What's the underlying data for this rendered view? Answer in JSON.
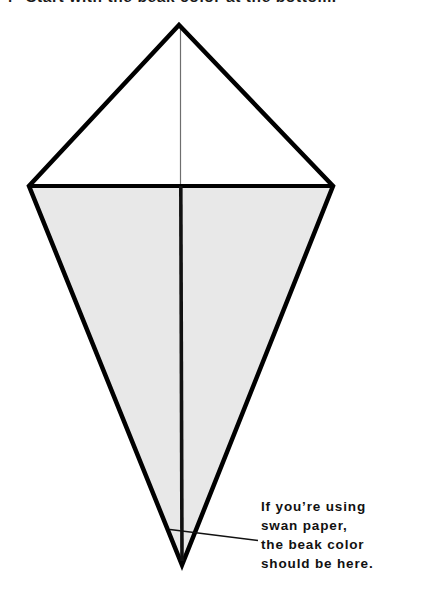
{
  "page": {
    "width": 425,
    "height": 612,
    "background_color": "#ffffff"
  },
  "heading": {
    "step_number": "4",
    "text": "Start with the beak color at the bottom.",
    "note": "clipped at top edge of screenshot"
  },
  "diagram": {
    "name": "origami-kite-base",
    "stroke_color": "#000000",
    "outline_stroke_width": 4.5,
    "upper_fill_color": "#ffffff",
    "lower_fill_color": "#e8e8e8",
    "center_line_upper_color": "#6e6e6e",
    "center_line_upper_width": 1.2,
    "center_line_lower_color": "#111111",
    "center_line_lower_width": 3.6,
    "horizontal_fold_color": "#000000",
    "horizontal_fold_width": 4.2,
    "points": {
      "top_apex": [
        179,
        25
      ],
      "left_vertex": [
        29,
        186
      ],
      "right_vertex": [
        333,
        186
      ],
      "bottom_point": [
        182,
        565
      ]
    }
  },
  "leader": {
    "name": "leader-line",
    "color": "#111111",
    "stroke_width": 1.6,
    "from": [
      183,
      531
    ],
    "to": [
      258,
      540
    ]
  },
  "caption": {
    "color": "#111111",
    "lines": [
      "If you’re using",
      "swan paper,",
      "the beak color",
      "should be here."
    ]
  }
}
